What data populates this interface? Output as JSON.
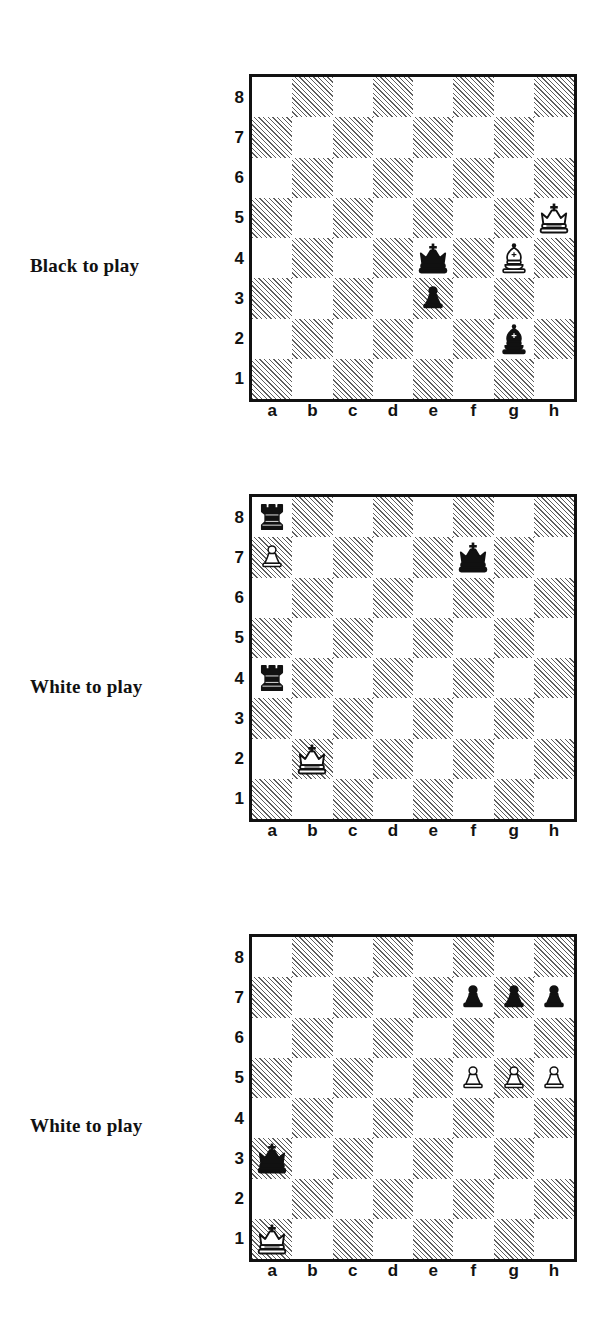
{
  "page": {
    "background": "#ffffff",
    "ink": "#111111",
    "dark_square_hatch": "#5e5e5e",
    "light_square": "#ffffff"
  },
  "coordinates": {
    "files": [
      "a",
      "b",
      "c",
      "d",
      "e",
      "f",
      "g",
      "h"
    ],
    "ranks": [
      "8",
      "7",
      "6",
      "5",
      "4",
      "3",
      "2",
      "1"
    ]
  },
  "piece_glyphs": {
    "white-king": "K",
    "black-king": "k",
    "white-queen": "Q",
    "black-queen": "q",
    "white-rook": "R",
    "black-rook": "r",
    "white-bishop": "B",
    "black-bishop": "b",
    "white-knight": "N",
    "black-knight": "n",
    "white-pawn": "P",
    "black-pawn": "p"
  },
  "diagrams": [
    {
      "id": "diagram-1",
      "caption": "Black to play",
      "side_to_move": "black",
      "fen": "8/8/8/7K/4k1B1/4p3/6b1/8 b - - 0 1",
      "pieces": [
        {
          "square": "h5",
          "piece": "white-king",
          "color": "white",
          "type": "king"
        },
        {
          "square": "e4",
          "piece": "black-king",
          "color": "black",
          "type": "king"
        },
        {
          "square": "g4",
          "piece": "white-bishop",
          "color": "white",
          "type": "bishop"
        },
        {
          "square": "e3",
          "piece": "black-pawn",
          "color": "black",
          "type": "pawn"
        },
        {
          "square": "g2",
          "piece": "black-bishop",
          "color": "black",
          "type": "bishop"
        }
      ]
    },
    {
      "id": "diagram-2",
      "caption": "White to play",
      "side_to_move": "white",
      "fen": "r7/P4k2/8/8/r7/8/1K6/8 w - - 0 1",
      "pieces": [
        {
          "square": "a8",
          "piece": "black-rook",
          "color": "black",
          "type": "rook"
        },
        {
          "square": "a7",
          "piece": "white-pawn",
          "color": "white",
          "type": "pawn"
        },
        {
          "square": "f7",
          "piece": "black-king",
          "color": "black",
          "type": "king"
        },
        {
          "square": "a4",
          "piece": "black-rook",
          "color": "black",
          "type": "rook"
        },
        {
          "square": "b2",
          "piece": "white-king",
          "color": "white",
          "type": "king"
        }
      ]
    },
    {
      "id": "diagram-3",
      "caption": "White to play",
      "side_to_move": "white",
      "fen": "8/5ppp/8/5PPP/8/k7/8/K7 w - - 0 1",
      "pieces": [
        {
          "square": "f7",
          "piece": "black-pawn",
          "color": "black",
          "type": "pawn"
        },
        {
          "square": "g7",
          "piece": "black-pawn",
          "color": "black",
          "type": "pawn"
        },
        {
          "square": "h7",
          "piece": "black-pawn",
          "color": "black",
          "type": "pawn"
        },
        {
          "square": "f5",
          "piece": "white-pawn",
          "color": "white",
          "type": "pawn"
        },
        {
          "square": "g5",
          "piece": "white-pawn",
          "color": "white",
          "type": "pawn"
        },
        {
          "square": "h5",
          "piece": "white-pawn",
          "color": "white",
          "type": "pawn"
        },
        {
          "square": "a3",
          "piece": "black-king",
          "color": "black",
          "type": "king"
        },
        {
          "square": "a1",
          "piece": "white-king",
          "color": "white",
          "type": "king"
        }
      ]
    }
  ],
  "layout": {
    "board_tops": [
      74,
      494,
      934
    ],
    "board_left": 249,
    "caption_left": 30,
    "caption_tops": [
      255,
      676,
      1115
    ]
  }
}
